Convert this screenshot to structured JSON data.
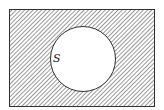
{
  "diagram": {
    "type": "venn",
    "title": "",
    "universe": {
      "label": "",
      "shaded": true
    },
    "sets": [
      {
        "label": "S",
        "shaded": false
      }
    ],
    "shaded_region": "complement of S",
    "colors": {
      "outline": "#333333",
      "hatch": "#555555",
      "background": "#ffffff",
      "set_fill": "#ffffff"
    }
  }
}
